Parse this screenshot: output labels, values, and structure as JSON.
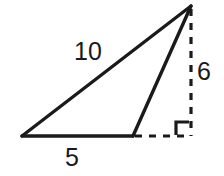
{
  "figure": {
    "kind": "geometry-diagram",
    "background_color": "#ffffff",
    "stroke_color": "#1a1a1a",
    "canvas": {
      "width": 224,
      "height": 176
    }
  },
  "labels": {
    "hypotenuse": "10",
    "base": "5",
    "height": "6"
  },
  "vertices": {
    "bottom_left": {
      "x": 22,
      "y": 136
    },
    "bottom_right": {
      "x": 133,
      "y": 136
    },
    "apex": {
      "x": 191,
      "y": 6
    },
    "foot": {
      "x": 191,
      "y": 136
    }
  },
  "segments": [
    {
      "name": "hypotenuse-side",
      "style": "solid",
      "label": "10",
      "from": "bottom_left",
      "to": "apex"
    },
    {
      "name": "base-side",
      "style": "solid",
      "label": "5",
      "from": "bottom_left",
      "to": "bottom_right"
    },
    {
      "name": "right-side",
      "style": "solid",
      "label": "",
      "from": "bottom_right",
      "to": "apex"
    },
    {
      "name": "altitude",
      "style": "dashed",
      "label": "6",
      "from": "apex",
      "to": "foot"
    },
    {
      "name": "base-extension",
      "style": "dashed",
      "label": "",
      "from": "bottom_right",
      "to": "foot"
    }
  ],
  "markers": {
    "right_angle": {
      "name": "right-angle-mark",
      "at": "foot",
      "size": 13
    }
  }
}
